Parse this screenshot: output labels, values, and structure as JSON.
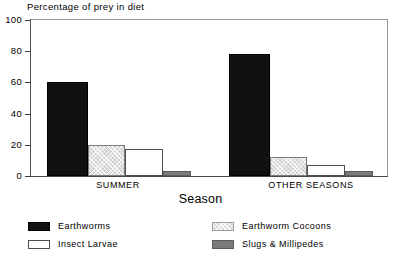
{
  "chart_data": {
    "type": "bar",
    "title": "Percentage of prey in diet",
    "xlabel": "Season",
    "ylabel": "",
    "ylim": [
      0,
      100
    ],
    "yticks": [
      0,
      20,
      40,
      60,
      80,
      100
    ],
    "grid": false,
    "legend_position": "bottom",
    "categories": [
      "SUMMER",
      "OTHER SEASONS"
    ],
    "series": [
      {
        "name": "Earthworms",
        "color": "#111111",
        "values": [
          60,
          78
        ]
      },
      {
        "name": "Earthworm Cocoons",
        "color": "#d8d8d8",
        "values": [
          20,
          12
        ]
      },
      {
        "name": "Insect Larvae",
        "color": "#ffffff",
        "values": [
          17,
          7
        ]
      },
      {
        "name": "Slugs & Millipedes",
        "color": "#7b7b7b",
        "values": [
          3,
          3
        ]
      }
    ]
  },
  "axis": {
    "y_tick_labels": [
      "100",
      "80",
      "60",
      "40",
      "20",
      "0"
    ],
    "x_title": "Season",
    "group_labels": [
      "SUMMER",
      "OTHER SEASONS"
    ]
  },
  "title": "Percentage of prey in diet",
  "legend": {
    "items": [
      {
        "label": "Earthworms",
        "swatch": "black-filled-swatch"
      },
      {
        "label": "Insect Larvae",
        "swatch": "white-open-swatch"
      },
      {
        "label": "Earthworm Cocoons",
        "swatch": "light-hatched-swatch"
      },
      {
        "label": "Slugs & Millipedes",
        "swatch": "gray-filled-swatch"
      }
    ]
  }
}
